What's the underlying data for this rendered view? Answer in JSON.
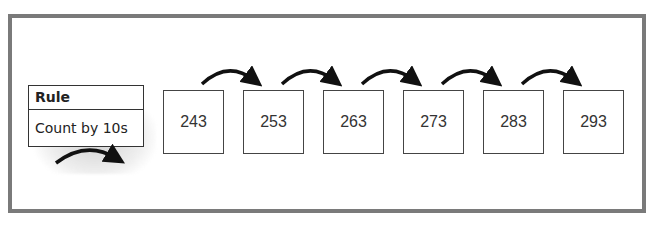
{
  "rule": {
    "title": "Rule",
    "text": "Count by 10s"
  },
  "sequence": [
    {
      "value": "243"
    },
    {
      "value": "253"
    },
    {
      "value": "263"
    },
    {
      "value": "273"
    },
    {
      "value": "283"
    },
    {
      "value": "293"
    }
  ],
  "arrows": {
    "count": 5,
    "icon": "curved-arrow-icon"
  },
  "colors": {
    "frame": "#7a7a7a",
    "box_border": "#444444",
    "arrow": "#111111",
    "text": "#333333"
  }
}
